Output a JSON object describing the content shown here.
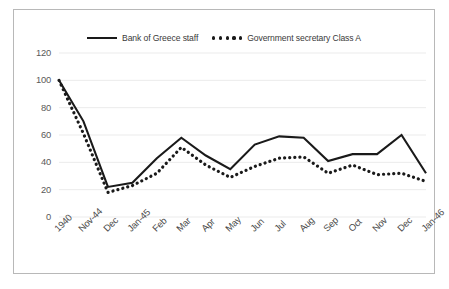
{
  "chart_data": {
    "type": "line",
    "title": "",
    "subtitle": "",
    "xlabel": "",
    "ylabel": "",
    "ylim": [
      0,
      120
    ],
    "yticks": [
      0,
      20,
      40,
      60,
      80,
      100,
      120
    ],
    "grid": true,
    "legend_position": "top-center",
    "categories": [
      "1940",
      "Nov-44",
      "Dec",
      "Jan-45",
      "Feb",
      "Mar",
      "Apr",
      "May",
      "Jun",
      "Jul",
      "Aug",
      "Sep",
      "Oct",
      "Nov",
      "Dec",
      "Jan-46"
    ],
    "series": [
      {
        "name": "Bank of Greece staff",
        "style": "solid",
        "color": "#1a1a1a",
        "values": [
          100,
          70,
          22,
          25,
          43,
          58,
          45,
          35,
          53,
          59,
          58,
          41,
          46,
          46,
          60,
          32
        ]
      },
      {
        "name": "Government secretary Class A",
        "style": "dotted",
        "color": "#1a1a1a",
        "values": [
          100,
          61,
          18,
          23,
          32,
          51,
          38,
          29,
          37,
          43,
          44,
          32,
          38,
          31,
          32,
          26
        ]
      }
    ]
  },
  "legend": {
    "entries": [
      {
        "label": "Bank of Greece staff",
        "marker": "solid-line-swatch"
      },
      {
        "label": "Government secretary Class A",
        "marker": "dotted-line-swatch"
      }
    ]
  }
}
